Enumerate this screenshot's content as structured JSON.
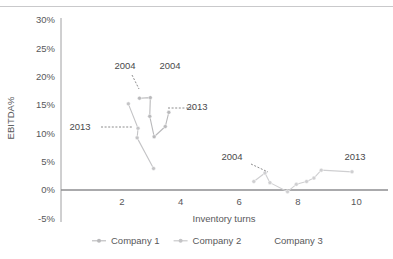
{
  "chart_data": {
    "type": "scatter",
    "title": "",
    "xlabel": "Inventory turns",
    "ylabel": "EBITDA%",
    "xlim": [
      0.4,
      10.6
    ],
    "ylim": [
      -5,
      30
    ],
    "xticks": [
      2,
      4,
      6,
      8,
      10
    ],
    "xtick_labels": [
      "2",
      "4",
      "6",
      "8",
      "10"
    ],
    "yticks": [
      -5,
      0,
      5,
      10,
      15,
      20,
      25,
      30
    ],
    "ytick_labels": [
      "-5%",
      "0%",
      "5%",
      "10%",
      "15%",
      "20%",
      "25%",
      "30%"
    ],
    "grid": false,
    "legend_position": "bottom",
    "zero_line": true,
    "series": [
      {
        "name": "Company 1",
        "color": "#b9b9bb",
        "marker": "circle",
        "points": [
          {
            "x": 2.6,
            "y": 16.2
          },
          {
            "x": 2.97,
            "y": 16.3
          },
          {
            "x": 2.95,
            "y": 13.0
          },
          {
            "x": 3.1,
            "y": 9.4
          },
          {
            "x": 3.48,
            "y": 11.2
          },
          {
            "x": 3.6,
            "y": 13.7
          }
        ],
        "start_label": "2004",
        "end_label": "2013"
      },
      {
        "name": "Company 2",
        "color": "#c4c4c6",
        "marker": "circle",
        "points": [
          {
            "x": 2.22,
            "y": 15.2
          },
          {
            "x": 2.55,
            "y": 10.9
          },
          {
            "x": 2.52,
            "y": 9.2
          },
          {
            "x": 3.08,
            "y": 3.8
          }
        ],
        "start_label": "2013",
        "end_label": ""
      },
      {
        "name": "Company 3",
        "color": "#cfcfd1",
        "marker": "circle",
        "points": [
          {
            "x": 6.5,
            "y": 1.5
          },
          {
            "x": 6.88,
            "y": 3.0
          },
          {
            "x": 7.05,
            "y": 1.3
          },
          {
            "x": 7.65,
            "y": -0.3
          },
          {
            "x": 7.95,
            "y": 1.0
          },
          {
            "x": 8.3,
            "y": 1.5
          },
          {
            "x": 8.55,
            "y": 2.1
          },
          {
            "x": 8.8,
            "y": 3.5
          },
          {
            "x": 9.85,
            "y": 3.2
          }
        ],
        "start_label": "2004",
        "end_label": "2013"
      }
    ],
    "annotations": [
      {
        "id": "ann-2004-company1",
        "text": "2004",
        "x": 125,
        "y": 69
      },
      {
        "id": "ann-2004-extra",
        "text": "2004",
        "x": 170,
        "y": 69
      },
      {
        "id": "ann-2013-company2",
        "text": "2013",
        "x": 80,
        "y": 130
      },
      {
        "id": "ann-2013-company1",
        "text": "2013",
        "x": 197,
        "y": 110
      },
      {
        "id": "ann-2004-company3",
        "text": "2004",
        "x": 232,
        "y": 160
      },
      {
        "id": "ann-2013-company3",
        "text": "2013",
        "x": 355,
        "y": 160
      }
    ]
  },
  "legend": {
    "items": [
      {
        "label": "Company 1",
        "color": "#b9b9bb"
      },
      {
        "label": "Company 2",
        "color": "#c4c4c6"
      },
      {
        "label": "Company 3",
        "color": "#cfcfd1"
      }
    ]
  },
  "colors": {
    "axis": "#8e8e90",
    "text": "#58585a",
    "rule": "#c9c9cb"
  }
}
